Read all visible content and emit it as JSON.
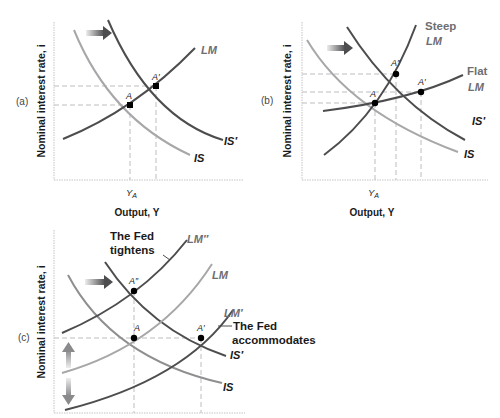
{
  "colors": {
    "curve_dark": "#4d4d4f",
    "curve_mid": "#7d7d80",
    "curve_light": "#a7a7aa",
    "axis": "#bfbfc2",
    "guide": "#bdbdc0",
    "text": "#1a1a1a",
    "label_gray": "#6e6e72",
    "point": "#000000"
  },
  "panels": {
    "a": {
      "tag": "(a)",
      "y_axis_label": "Nominal interest rate, i",
      "x_axis_label": "Output, Y",
      "x_tick": "YA",
      "curves": {
        "lm": "LM",
        "is": "IS",
        "is_prime": "IS′"
      },
      "points": {
        "a": "A",
        "a_prime": "A′"
      }
    },
    "b": {
      "tag": "(b)",
      "y_axis_label": "Nominal interest rate, i",
      "x_axis_label": "Output, Y",
      "x_tick": "YA",
      "curves": {
        "steep_lm_1": "Steep",
        "steep_lm_2": "LM",
        "flat_lm_1": "Flat",
        "flat_lm_2": "LM",
        "is": "IS",
        "is_prime": "IS′"
      },
      "points": {
        "a": "A",
        "a_prime": "A′",
        "a_double_prime": "A″"
      }
    },
    "c": {
      "tag": "(c)",
      "y_axis_label": "Nominal interest rate, i",
      "curves": {
        "lm_double_prime": "LM″",
        "lm": "LM",
        "lm_prime": "LM′",
        "is": "IS",
        "is_prime": "IS′"
      },
      "points": {
        "a": "A",
        "a_prime": "A′",
        "a_double_prime": "A″"
      },
      "annotations": {
        "tightens_1": "The Fed",
        "tightens_2": "tightens",
        "accommodates_1": "The Fed",
        "accommodates_2": "accommodates"
      }
    }
  }
}
